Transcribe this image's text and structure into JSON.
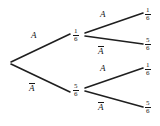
{
  "diagram": {
    "type": "probability-tree",
    "stroke_color": "#1f1f1f",
    "background_color": "#ffffff",
    "text_color": "#151515",
    "root": {
      "label": "",
      "x": 10,
      "y": 63
    },
    "stage1": {
      "branches": [
        {
          "event": "A",
          "overline": false,
          "probability": {
            "numerator": "1",
            "denominator": "6"
          },
          "label_x": 31,
          "label_y": 31,
          "node_x": 73,
          "node_y": 28,
          "line": {
            "x1": 11,
            "y1": 62,
            "x2": 70,
            "y2": 34
          }
        },
        {
          "event": "A",
          "overline": true,
          "probability": {
            "numerator": "5",
            "denominator": "6"
          },
          "label_x": 29,
          "label_y": 83,
          "node_x": 73,
          "node_y": 83,
          "line": {
            "x1": 11,
            "y1": 64,
            "x2": 70,
            "y2": 92
          }
        }
      ]
    },
    "stage2": {
      "branches": [
        {
          "parent": "A",
          "event": "A",
          "overline": false,
          "probability": {
            "numerator": "1",
            "denominator": "6"
          },
          "label_x": 100,
          "label_y": 10,
          "node_x": 145,
          "node_y": 7,
          "line": {
            "x1": 85,
            "y1": 33,
            "x2": 143,
            "y2": 13
          }
        },
        {
          "parent": "A",
          "event": "A",
          "overline": true,
          "probability": {
            "numerator": "5",
            "denominator": "6"
          },
          "label_x": 98,
          "label_y": 46,
          "node_x": 145,
          "node_y": 37,
          "line": {
            "x1": 85,
            "y1": 36,
            "x2": 143,
            "y2": 44
          }
        },
        {
          "parent": "Abar",
          "event": "A",
          "overline": false,
          "probability": {
            "numerator": "1",
            "denominator": "6"
          },
          "label_x": 100,
          "label_y": 64,
          "node_x": 145,
          "node_y": 62,
          "line": {
            "x1": 85,
            "y1": 88,
            "x2": 143,
            "y2": 68
          }
        },
        {
          "parent": "Abar",
          "event": "A",
          "overline": true,
          "probability": {
            "numerator": "5",
            "denominator": "6"
          },
          "label_x": 98,
          "label_y": 102,
          "node_x": 145,
          "node_y": 100,
          "line": {
            "x1": 85,
            "y1": 91,
            "x2": 143,
            "y2": 107
          }
        }
      ]
    }
  }
}
